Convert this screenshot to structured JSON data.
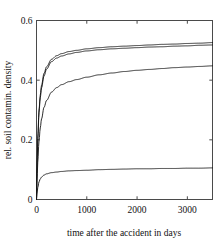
{
  "chart_data": {
    "type": "line",
    "title": "",
    "xlabel": "time after the accident in days",
    "ylabel": "rel. soil contamin. density",
    "xlim": [
      0,
      3500
    ],
    "ylim": [
      0,
      0.6
    ],
    "xticks": [
      0,
      1000,
      2000,
      3000
    ],
    "xtick_labels": [
      "0",
      "1000",
      "2000",
      "3000"
    ],
    "yticks": [
      0,
      0.2,
      0.4,
      0.6
    ],
    "ytick_labels": [
      "0",
      "0.2",
      "0.4",
      "0.6"
    ],
    "grid": false,
    "legend": "none",
    "frame": "box",
    "line_color": "#141414",
    "background_color": "#ffffff",
    "x": [
      0,
      10,
      25,
      50,
      75,
      100,
      150,
      200,
      300,
      400,
      500,
      650,
      800,
      1000,
      1250,
      1500,
      1750,
      2000,
      2250,
      2500,
      2750,
      3000,
      3250,
      3500
    ],
    "series": [
      {
        "name": "curve-1-upper",
        "values": [
          0.0,
          0.105,
          0.205,
          0.3,
          0.35,
          0.383,
          0.423,
          0.445,
          0.47,
          0.482,
          0.489,
          0.496,
          0.5,
          0.505,
          0.509,
          0.512,
          0.514,
          0.516,
          0.518,
          0.52,
          0.521,
          0.523,
          0.524,
          0.526
        ]
      },
      {
        "name": "curve-2-upper-inner",
        "values": [
          0.0,
          0.1,
          0.197,
          0.291,
          0.341,
          0.374,
          0.414,
          0.437,
          0.462,
          0.474,
          0.481,
          0.488,
          0.493,
          0.498,
          0.502,
          0.505,
          0.507,
          0.509,
          0.511,
          0.512,
          0.514,
          0.515,
          0.517,
          0.518
        ]
      },
      {
        "name": "curve-3-middle",
        "values": [
          0.0,
          0.06,
          0.125,
          0.196,
          0.24,
          0.27,
          0.309,
          0.332,
          0.36,
          0.375,
          0.385,
          0.395,
          0.402,
          0.41,
          0.418,
          0.424,
          0.429,
          0.433,
          0.436,
          0.439,
          0.442,
          0.444,
          0.446,
          0.448
        ]
      },
      {
        "name": "curve-4-lower",
        "values": [
          0.0,
          0.02,
          0.04,
          0.059,
          0.069,
          0.075,
          0.082,
          0.086,
          0.09,
          0.092,
          0.094,
          0.096,
          0.097,
          0.098,
          0.1,
          0.101,
          0.102,
          0.103,
          0.103,
          0.104,
          0.104,
          0.105,
          0.105,
          0.106
        ]
      }
    ]
  }
}
